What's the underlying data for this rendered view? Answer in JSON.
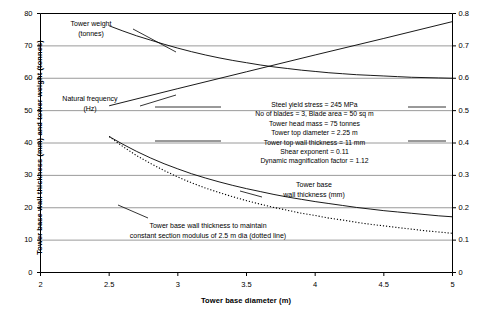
{
  "chart_data": {
    "type": "line",
    "title": "",
    "xlabel": "Tower base diameter (m)",
    "ylabel": "Tower base wall thickness (mm) and tower weight (tonnes)",
    "y2label": "Tower natural frequency (Hz)",
    "xlim": [
      2,
      5
    ],
    "ylim": [
      0,
      80
    ],
    "y2lim": [
      0,
      0.8
    ],
    "xticks": [
      "2",
      "2.5",
      "3",
      "3.5",
      "4",
      "4.5",
      "5"
    ],
    "xtick_values": [
      2,
      2.5,
      3,
      3.5,
      4,
      4.5,
      5
    ],
    "yticks": [
      "0",
      "10",
      "20",
      "30",
      "40",
      "50",
      "60",
      "70",
      "80"
    ],
    "ytick_values": [
      0,
      10,
      20,
      30,
      40,
      50,
      60,
      70,
      80
    ],
    "y2ticks": [
      "0",
      "0.1",
      "0.2",
      "0.3",
      "0.4",
      "0.5",
      "0.6",
      "0.7",
      "0.8"
    ],
    "y2tick_values": [
      0,
      0.1,
      0.2,
      0.3,
      0.4,
      0.5,
      0.6,
      0.7,
      0.8
    ],
    "grid": true,
    "legend": "none (in-plot curve labels)",
    "series": [
      {
        "name": "Tower weight (tonnes)",
        "axis": "left",
        "style": "solid",
        "x": [
          2.5,
          2.6,
          2.7,
          2.8,
          2.9,
          3.0,
          3.1,
          3.2,
          3.3,
          3.4,
          3.5,
          3.6,
          3.7,
          3.8,
          3.9,
          4.0,
          4.1,
          4.2,
          4.3,
          4.4,
          4.5,
          4.6,
          4.7,
          4.8,
          4.9,
          5.0
        ],
        "values": [
          76.2,
          74.6,
          73.1,
          71.8,
          70.5,
          69.3,
          68.2,
          67.2,
          66.3,
          65.5,
          64.8,
          64.1,
          63.5,
          63.0,
          62.5,
          62.1,
          61.7,
          61.4,
          61.1,
          60.9,
          60.7,
          60.5,
          60.3,
          60.2,
          60.1,
          60.0
        ]
      },
      {
        "name": "Natural frequency (Hz)",
        "axis": "right",
        "style": "solid",
        "x": [
          2.5,
          3.0,
          3.5,
          4.0,
          4.5,
          5.0
        ],
        "values": [
          0.515,
          0.568,
          0.62,
          0.672,
          0.723,
          0.775
        ]
      },
      {
        "name": "Tower base wall thickness (mm)",
        "axis": "left",
        "style": "solid",
        "x": [
          2.5,
          2.6,
          2.7,
          2.8,
          2.9,
          3.0,
          3.1,
          3.2,
          3.3,
          3.4,
          3.5,
          3.6,
          3.7,
          3.8,
          3.9,
          4.0,
          4.1,
          4.2,
          4.3,
          4.4,
          4.5,
          4.6,
          4.7,
          4.8,
          4.9,
          5.0
        ],
        "values": [
          42.0,
          39.6,
          37.4,
          35.4,
          33.6,
          32.0,
          30.5,
          29.2,
          28.0,
          26.9,
          25.9,
          25.0,
          24.1,
          23.3,
          22.6,
          21.9,
          21.3,
          20.7,
          20.1,
          19.6,
          19.1,
          18.7,
          18.3,
          17.9,
          17.5,
          17.2
        ]
      },
      {
        "name": "Tower base wall thickness to maintain constant section modulus of 2.5 m dia (dotted line)",
        "axis": "left",
        "style": "dotted",
        "x": [
          2.5,
          2.6,
          2.7,
          2.8,
          2.9,
          3.0,
          3.1,
          3.2,
          3.3,
          3.4,
          3.5,
          3.6,
          3.7,
          3.8,
          3.9,
          4.0,
          4.1,
          4.2,
          4.3,
          4.4,
          4.5,
          4.6,
          4.7,
          4.8,
          4.9,
          5.0
        ],
        "values": [
          42.0,
          38.9,
          36.1,
          33.7,
          31.5,
          29.5,
          27.7,
          26.1,
          24.7,
          23.4,
          22.2,
          21.1,
          20.1,
          19.2,
          18.3,
          17.6,
          16.8,
          16.2,
          15.5,
          14.9,
          14.4,
          13.9,
          13.4,
          12.9,
          12.5,
          12.1
        ]
      }
    ],
    "annotations": {
      "tower_weight": {
        "line1": "Tower weight",
        "line2": "(tonnes)"
      },
      "natural_frequency": {
        "line1": "Natural frequency",
        "line2": "(Hz)"
      },
      "wall_thickness": {
        "line1": "Tower base",
        "line2": "wall thickness (mm)"
      },
      "constant_modulus": {
        "line1": "Tower base wall thickness to maintain",
        "line2": "constant section modulus of 2.5 m dia (dotted line)"
      },
      "parameters": [
        "Steel yield stress = 245 MPa",
        "No of blades = 3, Blade area = 50 sq m",
        "Tower head mass = 75 tonnes",
        "Tower top diameter = 2.25 m",
        "Tower top wall thickness = 11 mm",
        "Shear exponent = 0.11",
        "Dynamic magnification factor = 1.12"
      ]
    },
    "colors": {
      "line": "#000000",
      "grid": "#808080",
      "axis": "#000000",
      "background": "#ffffff"
    }
  }
}
